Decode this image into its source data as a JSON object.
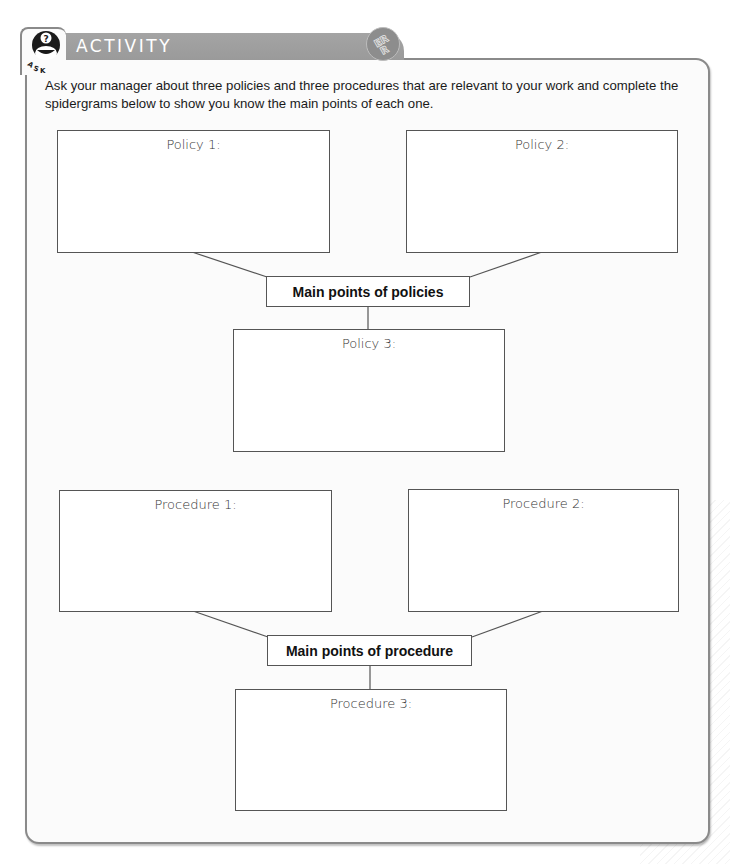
{
  "header": {
    "title": "ACTIVITY",
    "icon_label": "ASK",
    "icon": "question-person-icon",
    "badge": "ERR",
    "badge_icon": "err-badge-icon",
    "bar_color": "#9e9e9e"
  },
  "instructions": "Ask your manager about three policies and three procedures that are relevant to your work and complete the spidergrams below to show you know the main points of each one.",
  "policies": {
    "hub_label": "Main points of policies",
    "boxes": [
      {
        "label": "Policy 1:"
      },
      {
        "label": "Policy 2:"
      },
      {
        "label": "Policy 3:"
      }
    ]
  },
  "procedures": {
    "hub_label": "Main points of procedure",
    "boxes": [
      {
        "label": "Procedure 1:"
      },
      {
        "label": "Procedure 2:"
      },
      {
        "label": "Procedure 3:"
      }
    ]
  }
}
